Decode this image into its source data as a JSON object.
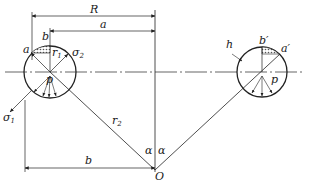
{
  "diagram": {
    "colors": {
      "line": "#222222",
      "hatch": "#555555",
      "background": "#ffffff"
    },
    "labels": {
      "R": "R",
      "a_top": "a",
      "b_top": "b",
      "a_left": "a",
      "r1": "r",
      "r1_sub": "1",
      "sigma2": "σ",
      "sigma2_sub": "2",
      "sigma1": "σ",
      "sigma1_sub": "1",
      "p_left_center": "p",
      "r2": "r",
      "r2_sub": "2",
      "alpha_left": "α",
      "alpha_right": "α",
      "b_bottom": "b",
      "O": "O",
      "h": "h",
      "b_prime": "b′",
      "a_prime": "a′",
      "p_right": "p"
    }
  }
}
